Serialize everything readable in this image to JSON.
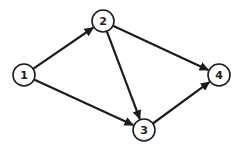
{
  "diagram": {
    "type": "directed-graph",
    "background": "#ffffff",
    "stroke_color": "#1c1c1c",
    "node_fill": "#ffffff",
    "node_stroke_width": 1.6,
    "edge_stroke_width": 2.2,
    "node_radius": 11,
    "label_font_size": 11,
    "nodes": [
      {
        "id": "1",
        "label": "1",
        "x": 24,
        "y": 75
      },
      {
        "id": "2",
        "label": "2",
        "x": 103,
        "y": 21
      },
      {
        "id": "3",
        "label": "3",
        "x": 144,
        "y": 130
      },
      {
        "id": "4",
        "label": "4",
        "x": 219,
        "y": 75
      }
    ],
    "edges": [
      {
        "from": "1",
        "to": "2"
      },
      {
        "from": "1",
        "to": "3"
      },
      {
        "from": "2",
        "to": "3"
      },
      {
        "from": "2",
        "to": "4"
      },
      {
        "from": "3",
        "to": "4"
      }
    ]
  }
}
